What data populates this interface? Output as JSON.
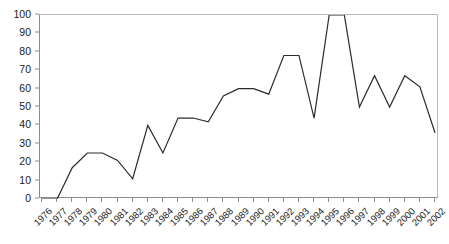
{
  "chart_data": {
    "type": "line",
    "title": "",
    "xlabel": "",
    "ylabel": "",
    "categories": [
      "1976",
      "1977",
      "1978",
      "1979",
      "1980",
      "1981",
      "1982",
      "1983",
      "1984",
      "1985",
      "1986",
      "1987",
      "1988",
      "1989",
      "1990",
      "1991",
      "1992",
      "1993",
      "1994",
      "1995",
      "1996",
      "1997",
      "1998",
      "1999",
      "2000",
      "2001",
      "2002"
    ],
    "values": [
      0,
      0,
      17,
      25,
      25,
      21,
      11,
      40,
      25,
      44,
      44,
      42,
      56,
      60,
      60,
      57,
      78,
      78,
      44,
      100,
      100,
      50,
      67,
      50,
      67,
      61,
      36
    ],
    "ylim": [
      0,
      100
    ],
    "ytick_labels": [
      "0",
      "10",
      "20",
      "30",
      "40",
      "50",
      "60",
      "70",
      "80",
      "90",
      "100"
    ],
    "ytick_values": [
      0,
      10,
      20,
      30,
      40,
      50,
      60,
      70,
      80,
      90,
      100
    ],
    "grid": false,
    "legend": null,
    "line_color": "#2b2b2b",
    "axis_color": "#8c8c8c",
    "background_color": "#ffffff"
  }
}
